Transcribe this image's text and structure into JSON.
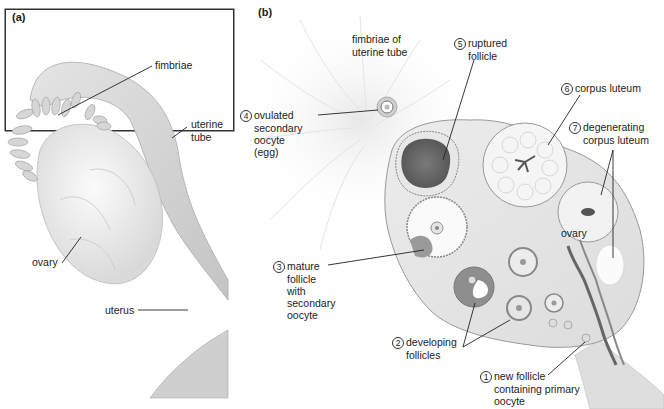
{
  "panel_a": {
    "tag": "(a)",
    "labels": {
      "fimbriae": "fimbriae",
      "uterine_tube_1": "uterine",
      "uterine_tube_2": "tube",
      "ovary": "ovary",
      "uterus": "uterus"
    }
  },
  "panel_b": {
    "tag": "(b)",
    "labels": {
      "fimbriae_1": "fimbriae of",
      "fimbriae_2": "uterine tube",
      "ovary": "ovary"
    },
    "stages": [
      {
        "num": "1",
        "lines": [
          "new follicle",
          "containing primary",
          "oocyte"
        ]
      },
      {
        "num": "2",
        "lines": [
          "developing",
          "follicles"
        ]
      },
      {
        "num": "3",
        "lines": [
          "mature",
          "follicle",
          "with",
          "secondary",
          "oocyte"
        ]
      },
      {
        "num": "4",
        "lines": [
          "ovulated",
          "secondary",
          "oocyte",
          "(egg)"
        ]
      },
      {
        "num": "5",
        "lines": [
          "ruptured",
          "follicle"
        ]
      },
      {
        "num": "6",
        "lines": [
          "corpus luteum"
        ]
      },
      {
        "num": "7",
        "lines": [
          "degenerating",
          "corpus luteum"
        ]
      }
    ]
  }
}
